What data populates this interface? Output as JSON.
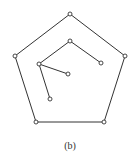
{
  "figure": {
    "caption": "(b)",
    "stroke_color": "#333333",
    "background": "#ffffff"
  },
  "graph": {
    "outer_cycle": {
      "nodes": [
        {
          "id": "o1",
          "x": 70,
          "y": 14
        },
        {
          "id": "o2",
          "x": 125,
          "y": 56
        },
        {
          "id": "o3",
          "x": 104,
          "y": 122
        },
        {
          "id": "o4",
          "x": 36,
          "y": 122
        },
        {
          "id": "o5",
          "x": 15,
          "y": 56
        }
      ],
      "edges": [
        [
          "o1",
          "o2"
        ],
        [
          "o2",
          "o3"
        ],
        [
          "o3",
          "o4"
        ],
        [
          "o4",
          "o5"
        ],
        [
          "o5",
          "o1"
        ]
      ]
    },
    "inner_tree": {
      "nodes": [
        {
          "id": "t1",
          "x": 70,
          "y": 41
        },
        {
          "id": "t2",
          "x": 101,
          "y": 63
        },
        {
          "id": "t3",
          "x": 39,
          "y": 64
        },
        {
          "id": "t4",
          "x": 68,
          "y": 74
        },
        {
          "id": "t5",
          "x": 50,
          "y": 99
        }
      ],
      "edges": [
        [
          "t1",
          "t2"
        ],
        [
          "t1",
          "t3"
        ],
        [
          "t3",
          "t4"
        ],
        [
          "t3",
          "t5"
        ]
      ]
    }
  }
}
